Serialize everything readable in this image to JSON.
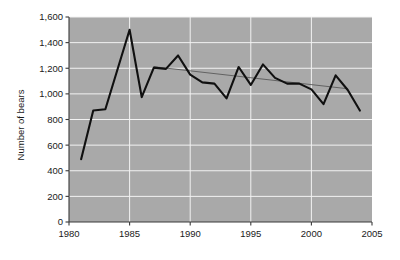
{
  "chart_data": {
    "type": "line",
    "title": "",
    "xlabel": "",
    "ylabel": "Number of bears",
    "xlim": [
      1980,
      2005
    ],
    "ylim": [
      0,
      1600
    ],
    "grid": true,
    "legend": "none",
    "background_color": "#a9a9a9",
    "gridline_color": "#f2f2f2",
    "line_color": "#101010",
    "trend_color": "#5a5a5a",
    "x_ticks": [
      1980,
      1985,
      1990,
      1995,
      2000,
      2005
    ],
    "x_tick_labels": [
      "1980",
      "1985",
      "1990",
      "1995",
      "2000",
      "2005"
    ],
    "y_ticks": [
      0,
      200,
      400,
      600,
      800,
      1000,
      1200,
      1400,
      1600
    ],
    "y_tick_labels": [
      "0",
      "200",
      "400",
      "600",
      "800",
      "1,000",
      "1,200",
      "1,400",
      "1,600"
    ],
    "series": [
      {
        "name": "Number of bears",
        "kind": "observed",
        "x": [
          1981,
          1982,
          1983,
          1984,
          1985,
          1986,
          1987,
          1988,
          1989,
          1990,
          1991,
          1992,
          1993,
          1994,
          1995,
          1996,
          1997,
          1998,
          1999,
          2000,
          2001,
          2002,
          2003,
          2004
        ],
        "values": [
          490,
          870,
          880,
          1190,
          1500,
          975,
          1205,
          1195,
          1300,
          1150,
          1090,
          1080,
          965,
          1210,
          1070,
          1230,
          1125,
          1080,
          1080,
          1035,
          920,
          1145,
          1030,
          870
        ]
      },
      {
        "name": "Trend",
        "kind": "trend",
        "x": [
          1987,
          2003
        ],
        "values": [
          1212,
          1040
        ]
      }
    ]
  }
}
